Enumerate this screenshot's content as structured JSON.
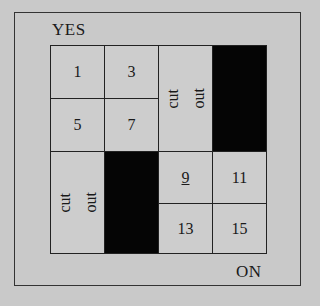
{
  "labels": {
    "top": "YES",
    "bottom": "ON"
  },
  "cells": {
    "c1": "1",
    "c3": "3",
    "c5": "5",
    "c7": "7",
    "c9": "9",
    "c11": "11",
    "c13": "13",
    "c15": "15",
    "cutout_top": {
      "line1": "cut",
      "line2": "out"
    },
    "cutout_bottom": {
      "line1": "cut",
      "line2": "out"
    }
  },
  "colors": {
    "background": "#c9c9c9",
    "filled": "#050505",
    "border": "#222222"
  }
}
